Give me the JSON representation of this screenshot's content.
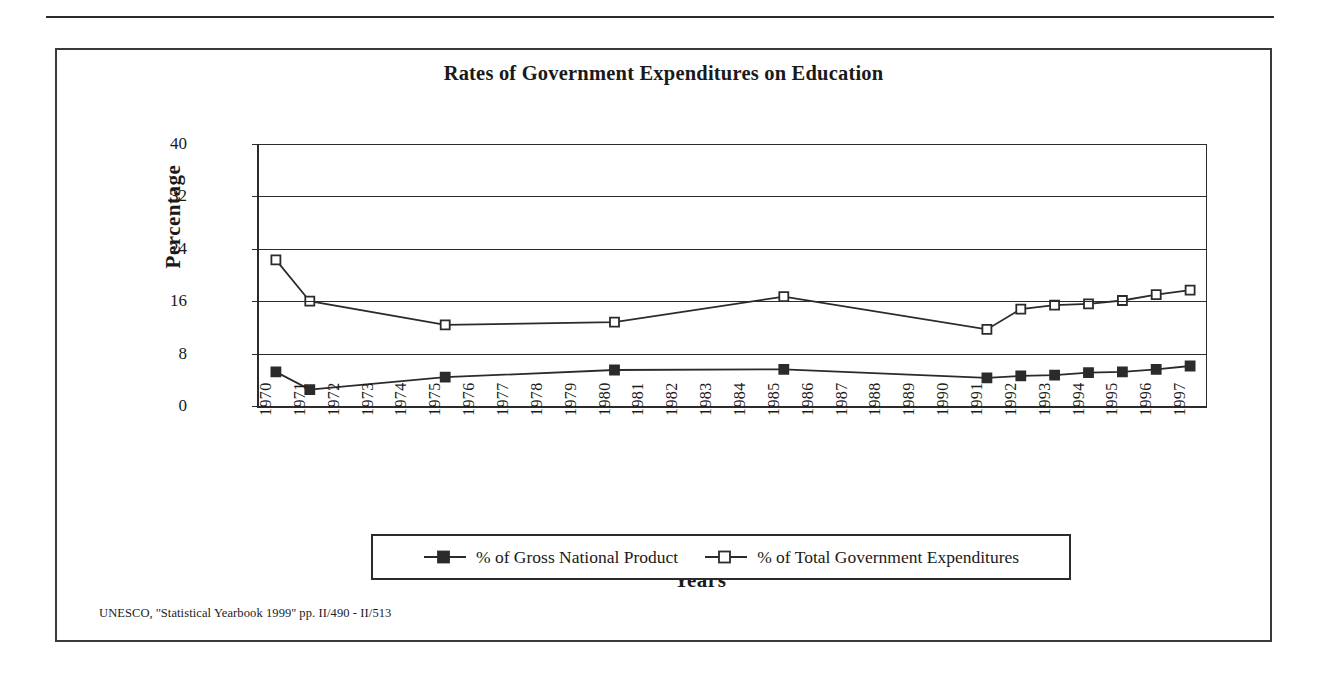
{
  "figure": {
    "title": "Rates of Government Expenditures on Education",
    "source_note": "UNESCO, ''Statistical Yearbook 1999'' pp. II/490 - II/513",
    "frame_color": "#3a3a3a"
  },
  "legend": {
    "position": "bottom",
    "entries": [
      {
        "label": "% of Gross National Product",
        "marker": "filled-square-marker",
        "color": "#2b2b2b"
      },
      {
        "label": "% of Total Government Expenditures",
        "marker": "open-square-marker",
        "color": "#2b2b2b"
      }
    ]
  },
  "chart_data": {
    "type": "line",
    "title": "Rates of Government Expenditures on Education",
    "xlabel": "Years",
    "ylabel": "Percentage",
    "ylim": [
      0,
      40
    ],
    "yticks": [
      0,
      8,
      16,
      24,
      32,
      40
    ],
    "grid": true,
    "categories": [
      "1970",
      "1971",
      "1972",
      "1973",
      "1974",
      "1975",
      "1976",
      "1977",
      "1978",
      "1979",
      "1980",
      "1981",
      "1982",
      "1983",
      "1984",
      "1985",
      "1986",
      "1987",
      "1988",
      "1989",
      "1990",
      "1991",
      "1992",
      "1993",
      "1994",
      "1995",
      "1996",
      "1997"
    ],
    "series": [
      {
        "name": "% of Gross National Product",
        "marker": "filled-square-marker",
        "color": "#2b2b2b",
        "values": [
          5.2,
          2.5,
          null,
          null,
          null,
          4.4,
          null,
          null,
          null,
          null,
          5.5,
          null,
          null,
          null,
          null,
          5.6,
          null,
          null,
          null,
          null,
          null,
          4.3,
          4.6,
          4.7,
          5.1,
          5.2,
          5.6,
          6.1
        ]
      },
      {
        "name": "% of Total Government Expenditures",
        "marker": "open-square-marker",
        "color": "#2b2b2b",
        "values": [
          22.3,
          16.0,
          null,
          null,
          null,
          12.4,
          null,
          null,
          null,
          null,
          12.8,
          null,
          null,
          null,
          null,
          16.7,
          null,
          null,
          null,
          null,
          null,
          11.7,
          14.8,
          15.4,
          15.6,
          16.1,
          17.0,
          17.7
        ]
      }
    ]
  }
}
